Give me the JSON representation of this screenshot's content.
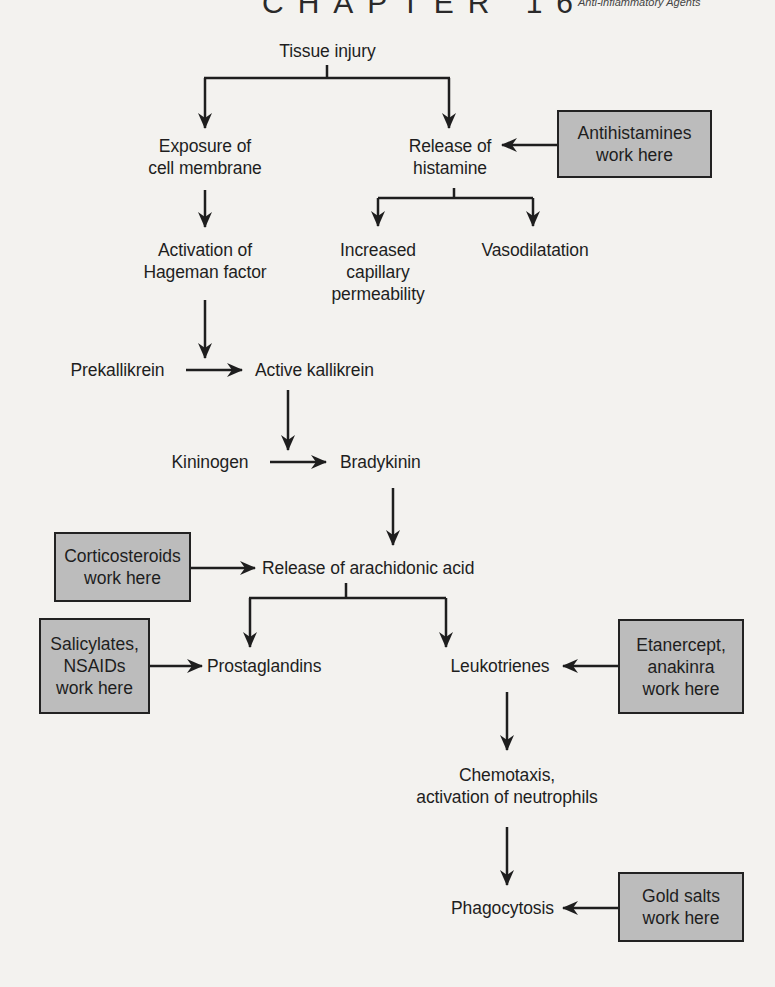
{
  "header": {
    "chapter": "CHAPTER 16",
    "subtitle": "Anti-inflammatory Agents"
  },
  "diagram": {
    "nodes": {
      "tissue_injury": "Tissue injury",
      "exposure_line1": "Exposure of",
      "exposure_line2": "cell membrane",
      "release_hist_line1": "Release of",
      "release_hist_line2": "histamine",
      "hageman_line1": "Activation of",
      "hageman_line2": "Hageman factor",
      "capillary_line1": "Increased",
      "capillary_line2": "capillary",
      "capillary_line3": "permeability",
      "vasodilatation": "Vasodilatation",
      "prekallikrein": "Prekallikrein",
      "active_kallikrein": "Active kallikrein",
      "kininogen": "Kininogen",
      "bradykinin": "Bradykinin",
      "arachidonic": "Release of arachidonic acid",
      "prostaglandins": "Prostaglandins",
      "leukotrienes": "Leukotrienes",
      "chemotaxis_line1": "Chemotaxis,",
      "chemotaxis_line2": "activation of neutrophils",
      "phagocytosis": "Phagocytosis"
    },
    "drug_boxes": {
      "antihistamines": {
        "line1": "Antihistamines",
        "line2": "work here"
      },
      "corticosteroids": {
        "line1": "Corticosteroids",
        "line2": "work here"
      },
      "nsaids": {
        "line1": "Salicylates,",
        "line2": "NSAIDs",
        "line3": "work here"
      },
      "etanercept": {
        "line1": "Etanercept,",
        "line2": "anakinra",
        "line3": "work here"
      },
      "gold_salts": {
        "line1": "Gold salts",
        "line2": "work here"
      }
    },
    "colors": {
      "box_fill": "#bcbcbc",
      "line": "#1e1e1e",
      "background": "#f3f2ef"
    }
  }
}
